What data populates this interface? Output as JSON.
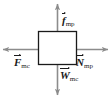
{
  "diagram": {
    "type": "free-body-diagram",
    "title": "",
    "body": {
      "shape": "rectangle",
      "fill_color": "#ffffff",
      "stroke_color": "#1a1a1a"
    },
    "colors": {
      "arrow": "#8c8c8c",
      "label": "#1a1a1a",
      "background": "#ffffff"
    },
    "forces": [
      {
        "name": "friction-force",
        "symbol": "f",
        "subscript": "mp",
        "direction": "up",
        "label": "f mp"
      },
      {
        "name": "weight-force",
        "symbol": "W",
        "subscript": "mc",
        "direction": "down",
        "label": "W mc"
      },
      {
        "name": "applied-force",
        "symbol": "F",
        "subscript": "mc",
        "direction": "left",
        "label": "F mc"
      },
      {
        "name": "normal-force",
        "symbol": "N",
        "subscript": "mp",
        "direction": "right",
        "label": "N mp"
      }
    ]
  }
}
